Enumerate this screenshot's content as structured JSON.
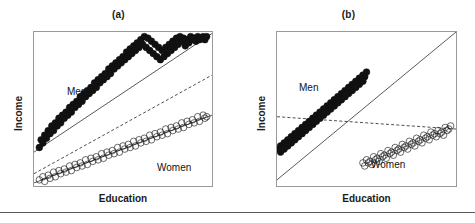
{
  "figure": {
    "footer_rule": true,
    "colors": {
      "men_marker_fill": "#111111",
      "women_marker_fill": "#ffffff",
      "marker_stroke": "#111111",
      "fit_line": "#111111",
      "pooled_line_dashed": "#111111",
      "plot_border": "#9a9a9a",
      "background": "#ffffff"
    }
  },
  "panels": [
    {
      "id": "a",
      "title": "(a)",
      "xlabel": "Education",
      "ylabel": "Income",
      "group_labels": {
        "men": "Men",
        "women": "Women"
      }
    },
    {
      "id": "b",
      "title": "(b)",
      "xlabel": "Education",
      "ylabel": "Income",
      "group_labels": {
        "men": "Men",
        "women": "Women"
      }
    }
  ],
  "chart_data": [
    {
      "panel": "a",
      "type": "scatter",
      "title": "(a)",
      "xlabel": "Education",
      "ylabel": "Income",
      "xlim": [
        0,
        100
      ],
      "ylim": [
        0,
        100
      ],
      "grid": false,
      "legend": "inline-annotation",
      "annotations": [
        {
          "text": "Men",
          "x": 22,
          "y": 66
        },
        {
          "text": "Women",
          "x": 70,
          "y": 17
        }
      ],
      "series": [
        {
          "name": "Men",
          "marker": "filled-circle",
          "points_x": [
            3,
            4,
            5,
            6,
            7,
            8,
            9,
            10,
            11,
            12,
            13,
            14,
            15,
            16,
            17,
            18,
            19,
            20,
            21,
            22,
            23,
            24,
            25,
            26,
            27,
            28,
            29,
            30,
            31,
            32,
            33,
            34,
            35,
            36,
            37,
            38,
            39,
            40,
            41,
            42,
            43,
            44,
            45,
            46,
            47,
            48,
            49,
            50,
            51,
            52,
            53,
            54,
            55,
            56,
            57,
            58,
            59,
            60,
            61,
            62,
            63,
            64,
            65,
            66,
            67,
            68,
            69,
            70,
            71,
            72,
            73,
            74,
            75,
            76,
            77,
            78,
            79,
            80,
            81,
            82,
            83,
            84,
            85,
            86,
            87,
            88,
            89,
            90,
            91,
            92,
            93,
            94,
            95,
            96,
            97
          ],
          "points_y": [
            25,
            30,
            28,
            33,
            31,
            36,
            34,
            39,
            36,
            41,
            39,
            44,
            41,
            46,
            44,
            48,
            46,
            51,
            48,
            53,
            51,
            55,
            53,
            58,
            55,
            60,
            58,
            62,
            60,
            64,
            62,
            67,
            64,
            69,
            67,
            71,
            69,
            73,
            71,
            76,
            73,
            78,
            76,
            80,
            78,
            82,
            80,
            84,
            82,
            87,
            84,
            89,
            86,
            91,
            88,
            93,
            90,
            95,
            92,
            97,
            90,
            96,
            88,
            94,
            86,
            92,
            84,
            90,
            82,
            88,
            84,
            90,
            86,
            92,
            88,
            94,
            90,
            96,
            92,
            97,
            94,
            96,
            91,
            95,
            93,
            97,
            95,
            96,
            94,
            97,
            95,
            96,
            97,
            95,
            97
          ],
          "fit_line": {
            "type": "solid",
            "x0": 0,
            "y0": 22,
            "x1": 100,
            "y1": 99
          }
        },
        {
          "name": "Women",
          "marker": "open-circle",
          "points_x": [
            3,
            5,
            6,
            8,
            9,
            11,
            12,
            14,
            15,
            17,
            18,
            20,
            21,
            23,
            24,
            26,
            27,
            29,
            30,
            32,
            33,
            35,
            36,
            38,
            39,
            41,
            42,
            44,
            45,
            47,
            48,
            50,
            51,
            53,
            54,
            56,
            57,
            59,
            60,
            62,
            63,
            65,
            66,
            68,
            69,
            71,
            72,
            74,
            75,
            77,
            78,
            80,
            81,
            83,
            84,
            86,
            87,
            89,
            90,
            92,
            93,
            95,
            96,
            97
          ],
          "points_y": [
            4,
            6,
            3,
            7,
            5,
            9,
            6,
            10,
            8,
            11,
            9,
            13,
            10,
            14,
            12,
            15,
            13,
            17,
            14,
            18,
            16,
            19,
            17,
            21,
            18,
            22,
            20,
            23,
            21,
            25,
            22,
            26,
            24,
            27,
            25,
            29,
            26,
            30,
            28,
            31,
            29,
            33,
            30,
            34,
            32,
            35,
            33,
            37,
            34,
            38,
            36,
            39,
            37,
            41,
            38,
            42,
            40,
            43,
            41,
            45,
            42,
            46,
            44,
            45
          ],
          "fit_line": {
            "type": "solid",
            "x0": 0,
            "y0": 2,
            "x1": 100,
            "y1": 46
          }
        }
      ],
      "pooled_regression_line": {
        "name": "pooled-regression",
        "type": "dashed",
        "x0": 0,
        "y0": 8,
        "x1": 100,
        "y1": 72
      }
    },
    {
      "panel": "b",
      "type": "scatter",
      "title": "(b)",
      "xlabel": "Education",
      "ylabel": "Income",
      "xlim": [
        0,
        100
      ],
      "ylim": [
        0,
        100
      ],
      "grid": false,
      "legend": "inline-annotation",
      "annotations": [
        {
          "text": "Men",
          "x": 14,
          "y": 69
        },
        {
          "text": "Women",
          "x": 55,
          "y": 17
        }
      ],
      "series": [
        {
          "name": "Men",
          "marker": "filled-circle",
          "points_x": [
            1,
            2,
            3,
            4,
            5,
            6,
            7,
            8,
            9,
            10,
            11,
            12,
            13,
            14,
            15,
            16,
            17,
            18,
            19,
            20,
            21,
            22,
            23,
            24,
            25,
            26,
            27,
            28,
            29,
            30,
            31,
            32,
            33,
            34,
            35,
            36,
            37,
            38,
            39,
            40,
            41,
            42,
            43,
            44,
            45,
            46,
            47,
            48,
            49,
            50,
            2,
            4,
            6,
            8,
            10,
            12,
            14,
            16,
            18,
            20,
            22,
            24,
            26,
            28,
            30,
            32,
            34,
            36,
            38,
            40,
            42,
            44,
            46,
            48
          ],
          "points_y": [
            24,
            26,
            25,
            28,
            27,
            30,
            29,
            32,
            31,
            34,
            33,
            36,
            35,
            38,
            37,
            40,
            39,
            42,
            41,
            44,
            43,
            46,
            45,
            48,
            47,
            50,
            49,
            52,
            51,
            54,
            53,
            56,
            55,
            58,
            57,
            60,
            59,
            62,
            61,
            64,
            63,
            66,
            65,
            68,
            67,
            70,
            69,
            72,
            71,
            74,
            22,
            24,
            26,
            28,
            30,
            32,
            34,
            36,
            38,
            40,
            42,
            44,
            46,
            48,
            50,
            52,
            54,
            56,
            58,
            60,
            62,
            64,
            66,
            68
          ],
          "fit_line": {
            "type": "none"
          }
        },
        {
          "name": "Women",
          "marker": "open-circle",
          "points_x": [
            48,
            50,
            52,
            54,
            56,
            58,
            60,
            62,
            64,
            66,
            68,
            70,
            72,
            74,
            76,
            78,
            80,
            82,
            84,
            86,
            88,
            90,
            92,
            94,
            96,
            97,
            49,
            51,
            53,
            55,
            57,
            59,
            61,
            63,
            65,
            67,
            69,
            71,
            73,
            75,
            77,
            79,
            81,
            83,
            85,
            87,
            89,
            91,
            93,
            95
          ],
          "points_y": [
            15,
            17,
            16,
            19,
            18,
            21,
            20,
            23,
            22,
            25,
            24,
            27,
            26,
            29,
            28,
            31,
            30,
            33,
            32,
            35,
            34,
            36,
            35,
            38,
            37,
            39,
            13,
            15,
            14,
            17,
            16,
            19,
            18,
            21,
            20,
            23,
            22,
            25,
            24,
            27,
            26,
            29,
            28,
            31,
            30,
            33,
            32,
            34,
            33,
            36
          ],
          "fit_line": {
            "type": "none"
          }
        }
      ],
      "pooled_regression_line": {
        "name": "pooled-regression",
        "type": "dashed",
        "x0": 0,
        "y0": 45,
        "x1": 100,
        "y1": 37
      },
      "true_relationship_line": {
        "name": "within-group-slope",
        "type": "solid",
        "x0": 0,
        "y0": 4,
        "x1": 100,
        "y1": 100
      }
    }
  ]
}
